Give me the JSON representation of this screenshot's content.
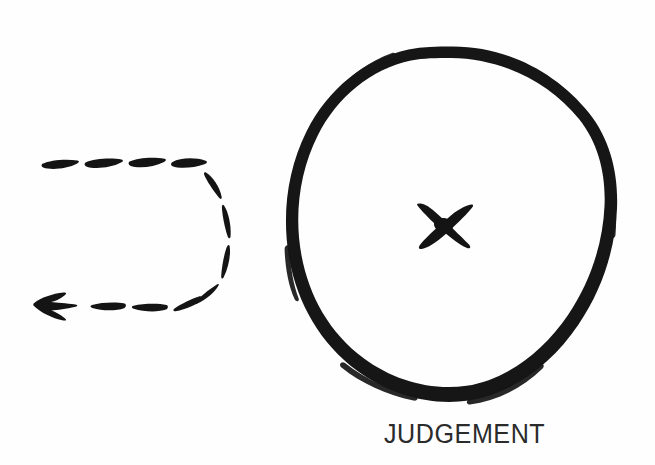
{
  "figure": {
    "kind": "hand-drawn-diagram",
    "background_color": "#fefefe",
    "ink_color": "#1a1a1a",
    "caption": {
      "text": "JUDGEMENT",
      "color": "#2b2b2b",
      "align": "below-circle"
    },
    "elements": [
      {
        "name": "u-turn-dashed-arrow",
        "description": "Dashed hand-drawn arrow making a U-turn, travelling right along the top, curving around a rounded right end, and returning leftwards along the bottom to a solid arrowhead pointing left",
        "direction": "leftward",
        "style": "dashed",
        "dash_count": 12,
        "bounds": {
          "x": 33,
          "y": 155,
          "width": 205,
          "height": 165
        },
        "arrowhead": {
          "name": "arrowhead",
          "shape": "barbed-triangle",
          "points_to": "left",
          "tip": {
            "x": 34,
            "y": 303
          }
        }
      },
      {
        "name": "hand-drawn-circle",
        "description": "Thick irregular hand-drawn circle outline",
        "center": {
          "x": 451,
          "y": 224
        },
        "radius_x": 163,
        "radius_y": 177,
        "stroke_width": 11
      },
      {
        "name": "x-mark",
        "description": "Hand-drawn X cross at the centre of the circle",
        "center": {
          "x": 444,
          "y": 225
        },
        "width": 54,
        "height": 46,
        "stroke_width": 8
      }
    ]
  }
}
